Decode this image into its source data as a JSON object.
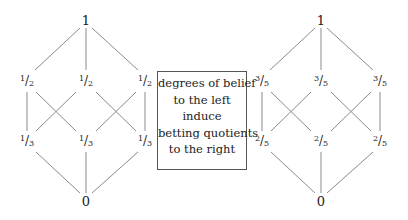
{
  "left_lattice": {
    "top": "1",
    "middle": [
      {
        "num": "1",
        "den": "2"
      },
      {
        "num": "1",
        "den": "2"
      },
      {
        "num": "1",
        "den": "2"
      }
    ],
    "lower": [
      {
        "num": "1",
        "den": "3"
      },
      {
        "num": "1",
        "den": "3"
      },
      {
        "num": "1",
        "den": "3"
      }
    ],
    "bottom": "0"
  },
  "right_lattice": {
    "top": "1",
    "middle": [
      {
        "num": "3",
        "den": "5"
      },
      {
        "num": "3",
        "den": "5"
      },
      {
        "num": "3",
        "den": "5"
      }
    ],
    "lower": [
      {
        "num": "2",
        "den": "5"
      },
      {
        "num": "2",
        "den": "5"
      },
      {
        "num": "2",
        "den": "5"
      }
    ],
    "bottom": "0"
  },
  "caption_box": {
    "lines": [
      "degrees of belief",
      "to the left",
      "induce",
      "betting quotients",
      "to the right"
    ]
  },
  "colors": {
    "edge": "#8a8a8a",
    "text": "#222222",
    "box_border": "#555555"
  }
}
